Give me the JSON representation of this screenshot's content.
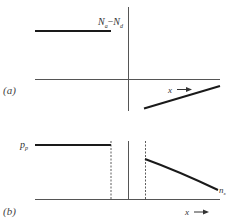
{
  "figure": {
    "panel_a": {
      "label": "(a)",
      "y_label_main": "N",
      "y_label_sub_a": "a",
      "y_label_minus": "−",
      "y_label_main2": "N",
      "y_label_sub_d": "d",
      "x_label": "x",
      "description": "Net impurity concentration N_a − N_d vs position x: constant positive on p-side, linearly graded negative on n-side"
    },
    "panel_b": {
      "label": "(b)",
      "left_label_main": "p",
      "left_label_sub": "p",
      "right_label_main": "n",
      "right_label_sub": "x",
      "x_label": "x",
      "description": "Carrier concentration: constant p_p on p-side, depletion region bounded by dashed lines, decreasing n_x on n-side"
    },
    "colors": {
      "line": "#1a1a1a",
      "axis": "#555555",
      "background": "#ffffff"
    }
  }
}
